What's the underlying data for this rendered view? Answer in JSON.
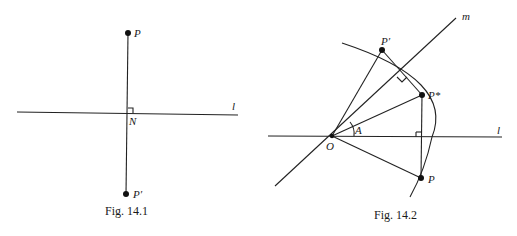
{
  "figures": [
    {
      "id": "fig-14-1",
      "caption": "Fig. 14.1",
      "labels": {
        "P": "P",
        "N": "N",
        "P_prime": "P′",
        "l": "l"
      },
      "points": {
        "P": [
          128,
          33
        ],
        "N": [
          128,
          113
        ],
        "P_prime": [
          126,
          194
        ]
      },
      "line_l": [
        [
          17,
          112
        ],
        [
          238,
          115
        ]
      ],
      "right_angle_at": "N"
    },
    {
      "id": "fig-14-2",
      "caption": "Fig. 14.2",
      "labels": {
        "P": "P",
        "P_star": "P*",
        "P_prime": "P′",
        "O": "O",
        "A": "A",
        "l": "l",
        "m": "m"
      },
      "points": {
        "O": [
          332,
          136
        ],
        "P_prime": [
          382,
          50
        ],
        "P_star": [
          422,
          95
        ],
        "P": [
          421,
          178
        ]
      },
      "line_l": [
        [
          268,
          136
        ],
        [
          502,
          137
        ]
      ],
      "line_m": [
        [
          275,
          186
        ],
        [
          456,
          18
        ]
      ],
      "arc_center": "O",
      "angle_label": "A",
      "right_angles": [
        "foot of P-P* on l",
        "midpoint of P′-P* on m"
      ]
    }
  ]
}
